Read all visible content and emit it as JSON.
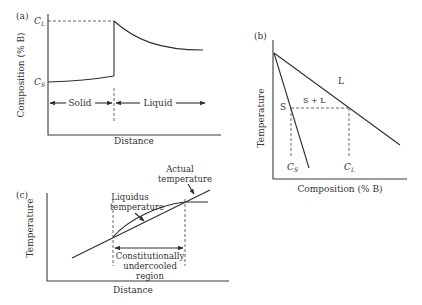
{
  "panels": {
    "a": {
      "tag": "(a)",
      "ylabel": "Composition (% B)",
      "xlabel": "Distance",
      "level_high": "C",
      "level_high_sub": "L",
      "level_low": "C",
      "level_low_sub": "S",
      "region_left": "Solid",
      "region_right": "Liquid"
    },
    "b": {
      "tag": "(b)",
      "ylabel": "Temperature",
      "xlabel": "Composition (% B)",
      "region_solid": "S",
      "region_two_phase": "S + L",
      "region_liquid": "L",
      "cs_label": "C",
      "cs_sub": "S",
      "cl_label": "C",
      "cl_sub": "L"
    },
    "c": {
      "tag": "(c)",
      "ylabel": "Temperature",
      "xlabel": "Distance",
      "liquidus_label_1": "Liquidus",
      "liquidus_label_2": "temperature",
      "actual_label_1": "Actual",
      "actual_label_2": "temperature",
      "region_label_1": "Constitutionally",
      "region_label_2": "undercooled",
      "region_label_3": "region"
    }
  }
}
